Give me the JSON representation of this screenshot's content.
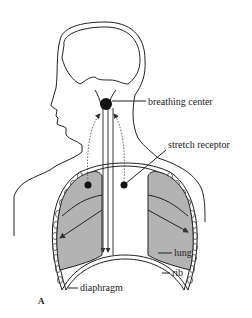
{
  "diagram": {
    "panel_letter": "A",
    "labels": {
      "breathing_center": "breathing center",
      "stretch_receptor": "stretch receptor",
      "lung": "lung",
      "rib": "rib",
      "diaphragm": "diaphragm"
    },
    "colors": {
      "lung_fill": "#b3b3b3",
      "outline": "#222222",
      "background": "#ffffff"
    }
  }
}
